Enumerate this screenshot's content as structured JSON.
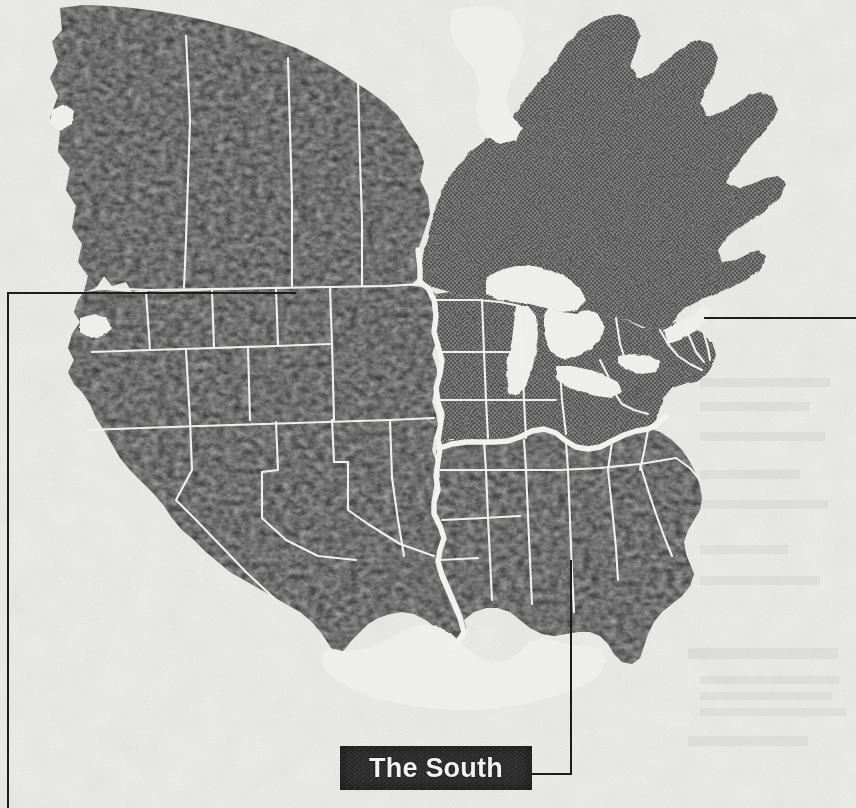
{
  "figure": {
    "kind": "shaded-region-map",
    "paper_color": "#eeeeec",
    "ink_color": "#1d1d1d"
  },
  "callout": {
    "label": "The South",
    "box_fill": "#2b2b2b",
    "text_color": "#f2f2f2",
    "leader_color": "#1d1d1d",
    "leader_anchor_region": "south"
  },
  "regions": [
    {
      "id": "west",
      "name": "The West",
      "tone": "dark",
      "fill": "#2e2e2e",
      "labeled_on_map": false
    },
    {
      "id": "south",
      "name": "The South",
      "tone": "dark",
      "fill": "#2e2e2e",
      "labeled_on_map": true
    },
    {
      "id": "midwest-northeast",
      "name": "Midwest and Northeast",
      "tone": "medium-gray-halftone",
      "fill": "#6e6e6e",
      "labeled_on_map": false
    },
    {
      "id": "canada-west",
      "name": "Western Canada",
      "tone": "dark",
      "fill": "#2e2e2e",
      "labeled_on_map": false
    },
    {
      "id": "canada-east",
      "name": "Eastern Canada",
      "tone": "medium-gray-halftone",
      "fill": "#6e6e6e",
      "labeled_on_map": false
    }
  ],
  "map_features": {
    "internal_borders": "thin white state and province lines",
    "region_boundary": "thick white dividing line",
    "water_bodies": [
      "Great Lakes",
      "Hudson Bay inlet",
      "Gulf of Mexico",
      "Pacific Ocean",
      "Atlantic Ocean"
    ],
    "border_color": "#f0f0ee"
  },
  "rules": [
    {
      "id": "rule-left",
      "orientation": "vertical",
      "color": "#1d1d1d"
    },
    {
      "id": "rule-topleft",
      "orientation": "horizontal",
      "color": "#1d1d1d"
    },
    {
      "id": "rule-right",
      "orientation": "horizontal",
      "color": "#1d1d1d"
    }
  ]
}
